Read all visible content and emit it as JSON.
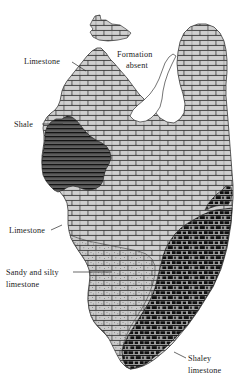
{
  "figure": {
    "type": "geologic-formation-map",
    "background_color": "#ffffff",
    "outline_color": "#3a3a3a",
    "label_color": "#1b1b1b",
    "width": 239,
    "height": 388
  },
  "labels": [
    {
      "id": "limestone-upper",
      "text": "Limestone",
      "lines": [
        "Limestone"
      ],
      "x": 24,
      "y": 64,
      "anchor": "start",
      "leader": "M 72,62 L 86,71"
    },
    {
      "id": "formation-absent",
      "text": "Formation absent",
      "lines": [
        "Formation",
        "absent"
      ],
      "x": 117,
      "y": 57,
      "anchor": "start",
      "leader": ""
    },
    {
      "id": "shale",
      "text": "Shale",
      "lines": [
        "Shale"
      ],
      "x": 14,
      "y": 127,
      "anchor": "start",
      "leader": "M 42,124 L 63,124"
    },
    {
      "id": "limestone-lower",
      "text": "Limestone",
      "lines": [
        "Limestone"
      ],
      "x": 9,
      "y": 233,
      "anchor": "start",
      "leader": "M 51,230 L 62,226"
    },
    {
      "id": "sandy-and-silty-limestone",
      "text": "Sandy and silty limestone",
      "lines": [
        "Sandy and silty",
        "limestone"
      ],
      "x": 6,
      "y": 275,
      "anchor": "start",
      "leader": "M 73,272 L 110,272"
    },
    {
      "id": "shaley-limestone",
      "text": "Shaley limestone",
      "lines": [
        "Shaley",
        "limestone"
      ],
      "x": 186,
      "y": 361,
      "anchor": "start",
      "leader": "M 184,358 L 172,352"
    }
  ],
  "units": [
    {
      "id": "limestone",
      "name": "Limestone",
      "pattern": "brick",
      "fill_color": "#b0b0b0"
    },
    {
      "id": "shale",
      "name": "Shale",
      "pattern": "horizontal-wavy-lines",
      "fill_color": "#5a5a5a"
    },
    {
      "id": "sandy-silty-limestone",
      "name": "Sandy and silty limestone",
      "pattern": "brick",
      "fill_color": "#b0b0b0"
    },
    {
      "id": "shaley-limestone",
      "name": "Shaley limestone",
      "pattern": "dark-dashed-brick",
      "fill_color": "#4a4a4a"
    },
    {
      "id": "formation-absent",
      "name": "Formation absent",
      "pattern": "none",
      "fill_color": "#ffffff"
    }
  ]
}
